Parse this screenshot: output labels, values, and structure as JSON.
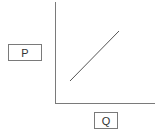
{
  "diagram": {
    "type": "supply-curve-axes",
    "y_axis_label": "P",
    "x_axis_label": "Q",
    "colors": {
      "axis": "#7a7a7a",
      "curve": "#555555",
      "label_border": "#7a7a7a",
      "text": "#333333"
    },
    "curve": {
      "start": [
        70,
        81
      ],
      "end": [
        119,
        31
      ]
    }
  }
}
